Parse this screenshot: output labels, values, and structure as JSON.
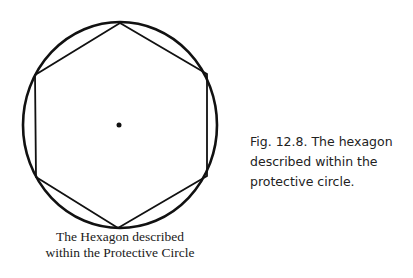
{
  "figure": {
    "colors": {
      "stroke": "#111111",
      "background": "#ffffff"
    },
    "circle": {
      "cx": 120,
      "cy": 125,
      "rx": 97,
      "ry": 103
    },
    "hexagon": {
      "vertices": [
        [
          120,
          23
        ],
        [
          207,
          74
        ],
        [
          207,
          176
        ],
        [
          118,
          228
        ],
        [
          36,
          177
        ],
        [
          35,
          75
        ]
      ]
    },
    "center_dot": {
      "cx": 119,
      "cy": 125,
      "r": 2.5
    },
    "label_lines": [
      "The Hexagon described",
      "within the Protective Circle"
    ]
  },
  "caption": {
    "lines": [
      "Fig. 12.8. The hexagon",
      "described within the",
      "protective circle."
    ]
  }
}
